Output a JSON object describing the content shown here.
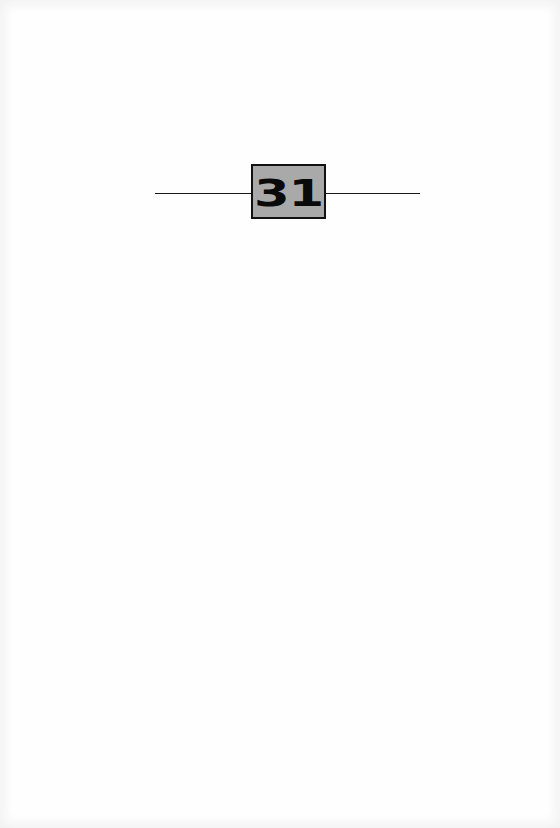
{
  "chapter": {
    "number": "31"
  },
  "colors": {
    "box_fill": "#a9a9a9",
    "box_border": "#111111",
    "rule": "#1a1a1a",
    "page": "#fefefe"
  }
}
